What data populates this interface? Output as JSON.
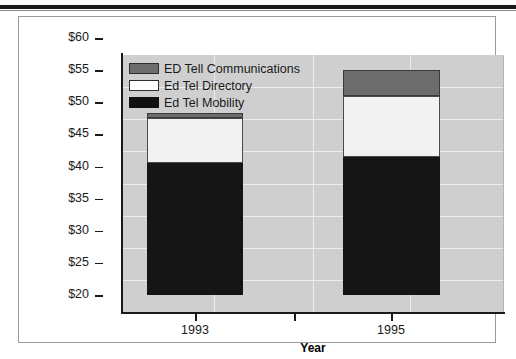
{
  "chart_data": {
    "type": "bar",
    "subtype": "stacked",
    "title": "",
    "xlabel": "Year",
    "ylabel": "Income from Continuing Operations (millions)",
    "categories": [
      "1993",
      "1995"
    ],
    "x_tick_labels": [
      "1993",
      "1995"
    ],
    "y_tick_labels": [
      "$60",
      "$55",
      "$50",
      "$45",
      "$40",
      "$35",
      "$30",
      "$25",
      "$20"
    ],
    "y_ticks": [
      60,
      55,
      50,
      45,
      40,
      35,
      30,
      25,
      20
    ],
    "ylim": [
      20,
      60
    ],
    "grid": true,
    "legend_position": "upper-left inside plot",
    "series": [
      {
        "name": "Ed Tel Mobility",
        "color": "#151515",
        "values": [
          40.5,
          41.5
        ]
      },
      {
        "name": "Ed Tel Directory",
        "color": "#f2f2f2",
        "values": [
          7.1,
          9.5
        ]
      },
      {
        "name": "ED Tell Communications",
        "color": "#6d6d6d",
        "values": [
          0.8,
          4.0
        ]
      }
    ],
    "cumulative_tops": {
      "1993": {
        "mobility": 40.5,
        "directory": 47.6,
        "communications": 48.4
      },
      "1995": {
        "mobility": 41.5,
        "directory": 51.0,
        "communications": 55.0
      }
    },
    "plot_background_color": "#cfcfcf",
    "gridline_color": "#ededed"
  },
  "axes": {
    "y_title": "Income from Continuing Operations (millions)",
    "x_title": "Year"
  },
  "legend": {
    "items": [
      {
        "label": "ED Tell Communications",
        "swatch": "dark-gray-swatch"
      },
      {
        "label": "Ed Tel Directory",
        "swatch": "white-swatch"
      },
      {
        "label": "Ed Tel Mobility",
        "swatch": "black-swatch"
      }
    ]
  }
}
